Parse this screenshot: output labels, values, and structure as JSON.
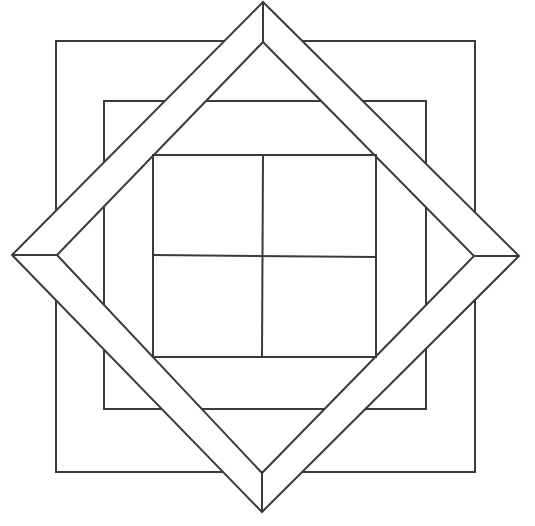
{
  "figure": {
    "stroke_color": "#3a3a3a",
    "background_color": "#ffffff",
    "outer_square": {
      "x1": 56,
      "y1": 41,
      "x2": 475,
      "y2": 472
    },
    "middle_square": {
      "x1": 104,
      "y1": 101,
      "x2": 426,
      "y2": 409
    },
    "inner_grid": {
      "x1": 153,
      "y1": 155,
      "x2": 376,
      "y2": 357,
      "mid_x": 263,
      "mid_y": 256,
      "rows": 2,
      "cols": 2
    },
    "diamond_outer": {
      "top": [
        263,
        2
      ],
      "right": [
        519,
        256
      ],
      "bottom": [
        262,
        512
      ],
      "left": [
        12,
        255
      ]
    },
    "diamond_inner": {
      "top": [
        263,
        42
      ],
      "right": [
        474,
        256
      ],
      "bottom": [
        262,
        473
      ],
      "left": [
        57,
        255
      ]
    }
  }
}
